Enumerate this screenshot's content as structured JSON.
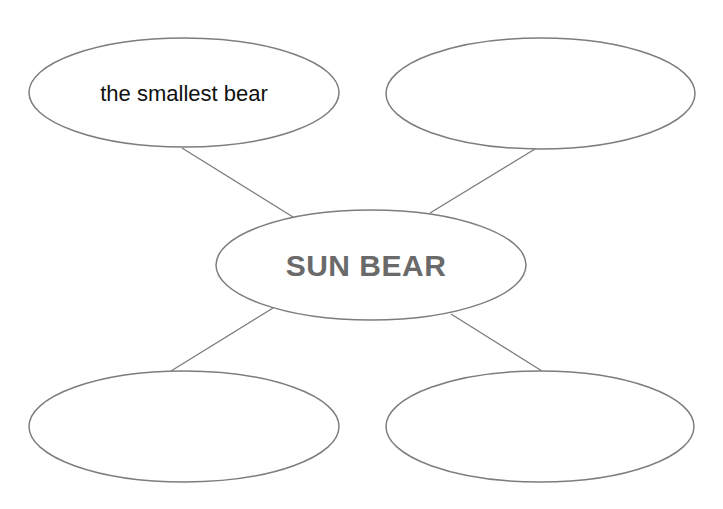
{
  "diagram": {
    "type": "concept-web",
    "stroke_color": "#7d7d7d",
    "center": {
      "label": "SUN BEAR",
      "text_color": "#6a6a6a"
    },
    "bubbles": [
      {
        "position": "top-left",
        "text": "the smallest bear"
      },
      {
        "position": "top-right",
        "text": ""
      },
      {
        "position": "bottom-left",
        "text": ""
      },
      {
        "position": "bottom-right",
        "text": ""
      }
    ]
  }
}
